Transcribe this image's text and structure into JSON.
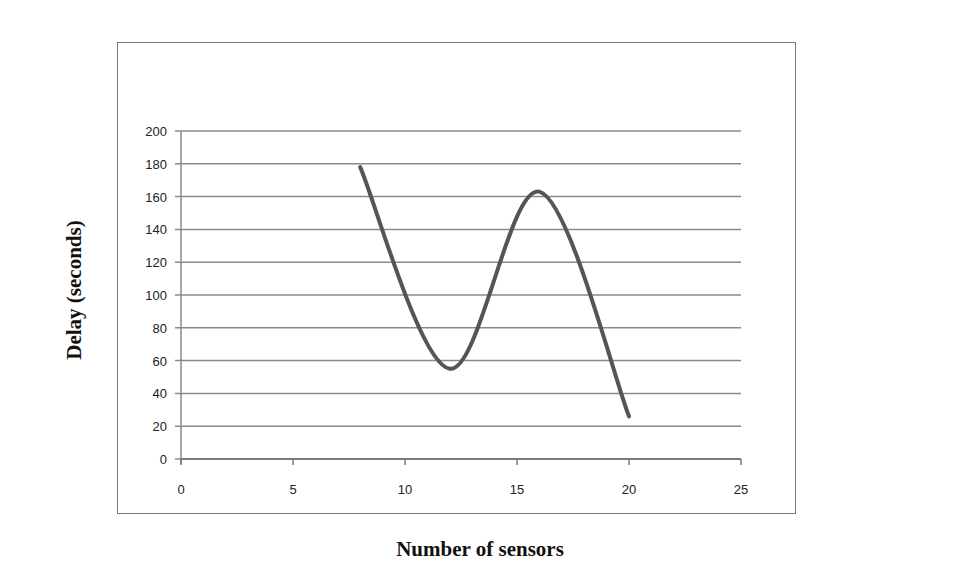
{
  "chart_data": {
    "type": "line",
    "title": "",
    "xlabel": "Number of sensors",
    "ylabel": "Delay (seconds)",
    "xlim": [
      0,
      25
    ],
    "ylim": [
      0,
      200
    ],
    "x_ticks": [
      "0",
      "5",
      "10",
      "15",
      "20",
      "25"
    ],
    "y_ticks": [
      "0",
      "20",
      "40",
      "60",
      "80",
      "100",
      "120",
      "140",
      "160",
      "180",
      "200"
    ],
    "grid": "horizontal",
    "legend": null,
    "series": [
      {
        "name": "Delay",
        "color": "#555555",
        "smooth": true,
        "x": [
          8,
          12,
          16,
          20
        ],
        "y": [
          178,
          55,
          163,
          26
        ]
      }
    ]
  }
}
